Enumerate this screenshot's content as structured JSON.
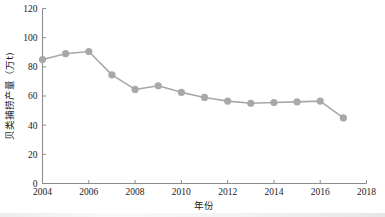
{
  "chart_data": {
    "type": "line",
    "title": "",
    "xlabel": "年份",
    "ylabel": "贝类捕捞产量（万t)",
    "xlim": [
      2004,
      2018
    ],
    "ylim": [
      0,
      120
    ],
    "xticks": [
      2004,
      2006,
      2008,
      2010,
      2012,
      2014,
      2016,
      2018
    ],
    "xtick_labels": [
      "2004",
      "2006",
      "2008",
      "2010",
      "2012",
      "2014",
      "2016",
      "2018"
    ],
    "yticks": [
      0,
      20,
      40,
      60,
      80,
      100,
      120
    ],
    "ytick_labels": [
      "0",
      "20",
      "40",
      "60",
      "80",
      "100",
      "120"
    ],
    "grid": false,
    "legend": null,
    "series": [
      {
        "name": "贝类捕捞产量",
        "color": "#a8a8a8",
        "marker": "circle",
        "x": [
          2004,
          2005,
          2006,
          2007,
          2008,
          2009,
          2010,
          2011,
          2012,
          2013,
          2014,
          2015,
          2016,
          2017
        ],
        "values": [
          85.0,
          89.0,
          90.5,
          74.5,
          64.5,
          67.0,
          62.5,
          59.0,
          56.5,
          55.0,
          55.5,
          56.0,
          56.5,
          45.0
        ]
      }
    ]
  },
  "colors": {
    "series": "#a8a8a8",
    "axis": "#8c8c8c",
    "text": "#1a1a1a",
    "background": "#ffffff"
  }
}
